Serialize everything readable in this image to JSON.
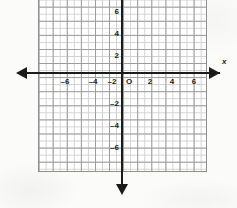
{
  "figure": {
    "kind": "cartesian-coordinate-grid",
    "background_color": "#fbfbfa",
    "grid_color": "#cfcfcf",
    "major_grid_color": "#9a9a9a",
    "axis_color": "#1b1b1b",
    "origin_label": "O",
    "x_axis_name": "x"
  },
  "chart_data": {
    "type": "scatter",
    "title": "",
    "subtitle": "",
    "xlabel": "x",
    "ylabel": "",
    "xlim": [
      -7,
      7
    ],
    "ylim": [
      -7,
      7
    ],
    "xticks": [
      -6,
      -4,
      -2,
      2,
      4,
      6
    ],
    "yticks": [
      6,
      4,
      2,
      -2,
      -4,
      -6
    ],
    "xtick_labels": [
      "-6",
      "-4",
      "-2",
      "2",
      "4",
      "6"
    ],
    "ytick_labels": [
      "6",
      "4",
      "2",
      "-2",
      "-4",
      "-6"
    ],
    "origin_label": "O",
    "grid": true,
    "minor_grid": true,
    "minor_ticks_per_unit": 2,
    "legend": null,
    "series": [],
    "annotations": [],
    "axis_arrows": [
      "left",
      "right",
      "down"
    ]
  },
  "x_ticks": [
    {
      "value": -6,
      "label": "-6",
      "left_px": 65
    },
    {
      "value": -4,
      "label": "-4",
      "left_px": 93
    },
    {
      "value": -2,
      "label": "-2",
      "left_px": 112
    },
    {
      "value": 2,
      "label": "2",
      "left_px": 150
    },
    {
      "value": 4,
      "label": "4",
      "left_px": 172
    },
    {
      "value": 6,
      "label": "6",
      "left_px": 194
    }
  ],
  "y_ticks": [
    {
      "value": 6,
      "label": "6",
      "top_px": 12
    },
    {
      "value": 4,
      "label": "4",
      "top_px": 34
    },
    {
      "value": 2,
      "label": "2",
      "top_px": 56
    },
    {
      "value": -2,
      "label": "-2",
      "top_px": 104
    },
    {
      "value": -4,
      "label": "-4",
      "top_px": 126
    },
    {
      "value": -6,
      "label": "-6",
      "top_px": 148
    }
  ]
}
